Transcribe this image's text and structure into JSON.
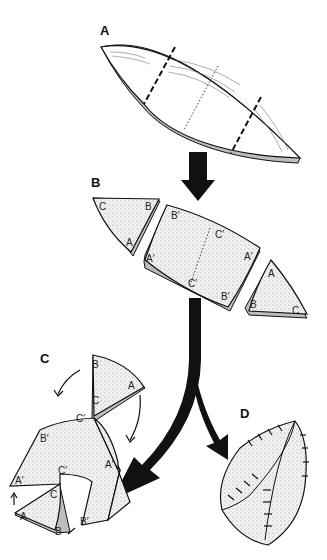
{
  "diagram": {
    "type": "assembly-steps illustration",
    "background": "#ffffff",
    "ink_color": "#111111",
    "steps": [
      {
        "id": "A",
        "label": "A",
        "description": "Lens-shaped slab marked with two dashed cut lines and a dotted center line"
      },
      {
        "id": "B",
        "label": "B",
        "description": "Slab cut into center rectangle and two triangular end pieces",
        "left_piece_labels": [
          "C",
          "B",
          "A"
        ],
        "center_piece_labels": [
          "B′",
          "C′",
          "A′",
          "A′",
          "C′",
          "B′"
        ],
        "right_piece_labels": [
          "A",
          "B",
          "C"
        ]
      },
      {
        "id": "C",
        "label": "C",
        "description": "Center folded along dotted line; triangles rotated into place (curved arrows)",
        "labels": [
          "B",
          "A",
          "C",
          "C′",
          "B′",
          "A′",
          "C′",
          "A′",
          "C",
          "A",
          "B",
          "B′"
        ]
      },
      {
        "id": "D",
        "label": "D",
        "description": "Pieces joined and stitched into closed pod shape"
      }
    ],
    "arrows": [
      {
        "from": "A",
        "to": "B",
        "style": "thick-straight"
      },
      {
        "from": "B",
        "to": "C",
        "style": "thick-curved"
      },
      {
        "from": "B",
        "to": "D",
        "style": "thick-curved"
      }
    ]
  }
}
